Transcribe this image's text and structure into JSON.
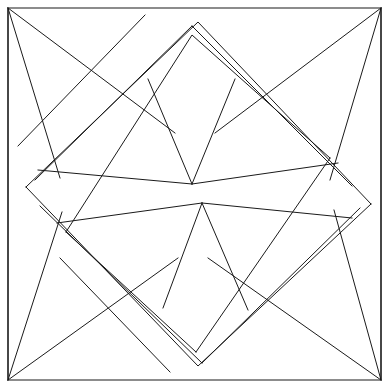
{
  "figure": {
    "width": 390,
    "height": 389,
    "background_color": "#ffffff",
    "stroke_color": "#1a1a1a",
    "stroke_width": 1,
    "fill": "none"
  },
  "geometry": {
    "frame": {
      "name": "outer-square",
      "points": "8,8 381,8 381,380 8,380"
    },
    "key_points": {
      "corner_top_left": [
        8,
        8
      ],
      "corner_top_right": [
        381,
        8
      ],
      "corner_bottom_left": [
        8,
        380
      ],
      "corner_bottom_right": [
        381,
        380
      ],
      "fan_apex_upper": [
        192,
        184
      ],
      "fan_apex_lower": [
        202,
        203
      ],
      "quad_apex_top": [
        192,
        26
      ],
      "quad_apex_bottom": [
        202,
        363
      ],
      "band_vertex_left": [
        26,
        187
      ],
      "band_vertex_right": [
        371,
        204
      ],
      "band_inner_left": [
        66,
        232
      ],
      "band_inner_right": [
        330,
        158
      ]
    },
    "paths": [
      {
        "name": "band-outer-upper",
        "d": "M 26 187 L 198 22 L 371 204"
      },
      {
        "name": "band-outer-lower",
        "d": "M 26 187 L 198 366 L 371 204"
      },
      {
        "name": "band-inner-upper",
        "d": "M 66 232 L 192 35 L 330 158"
      },
      {
        "name": "band-inner-lower-left",
        "d": "M 66 232 L 196 352"
      },
      {
        "name": "band-inner-lower-right",
        "d": "M 196 352 L 330 158"
      },
      {
        "name": "pinwheel-band-edge-a",
        "d": "M 18 146 L 145 15"
      },
      {
        "name": "pinwheel-band-edge-b",
        "d": "M 60 258 L 170 372"
      },
      {
        "name": "quad-top-left-edge",
        "d": "M 192 26 L 35 180"
      },
      {
        "name": "quad-top-right-edge",
        "d": "M 192 26 L 352 186"
      },
      {
        "name": "quad-bottom-left-edge",
        "d": "M 202 363 L 40 206"
      },
      {
        "name": "quad-bottom-right-edge",
        "d": "M 202 363 L 360 208"
      },
      {
        "name": "fan-upper-spoke-left",
        "d": "M 192 184 L 148 79"
      },
      {
        "name": "fan-upper-spoke-right",
        "d": "M 192 184 L 235 79"
      },
      {
        "name": "fan-upper-rim-left",
        "d": "M 192 184 L 38 170"
      },
      {
        "name": "fan-upper-rim-right",
        "d": "M 192 184 L 338 163"
      },
      {
        "name": "fan-lower-spoke-left",
        "d": "M 202 203 L 163 308"
      },
      {
        "name": "fan-lower-spoke-right",
        "d": "M 202 203 L 248 310"
      },
      {
        "name": "fan-lower-rim-left",
        "d": "M 202 203 L 57 223"
      },
      {
        "name": "fan-lower-rim-right",
        "d": "M 202 203 L 352 218"
      },
      {
        "name": "corner-tl-ray-1",
        "d": "M 8 8 L 175 133"
      },
      {
        "name": "corner-tl-ray-2",
        "d": "M 8 8 L 60 178"
      },
      {
        "name": "corner-tr-ray-1",
        "d": "M 381 8 L 215 133"
      },
      {
        "name": "corner-tr-ray-2",
        "d": "M 381 8 L 330 180"
      },
      {
        "name": "corner-bl-ray-1",
        "d": "M 8 380 L 178 258"
      },
      {
        "name": "corner-bl-ray-2",
        "d": "M 8 380 L 62 212"
      },
      {
        "name": "corner-br-ray-1",
        "d": "M 381 380 L 208 258"
      },
      {
        "name": "corner-br-ray-2",
        "d": "M 381 380 L 334 210"
      },
      {
        "name": "edge-tl-vertical",
        "d": "M 8 8 L 8 380"
      },
      {
        "name": "edge-tr-vertical",
        "d": "M 381 8 L 381 380"
      }
    ]
  }
}
